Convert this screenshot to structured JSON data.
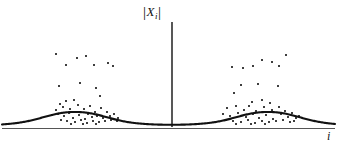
{
  "figure": {
    "title": "",
    "background_color": "#ffffff",
    "ink_color": "#111111",
    "width": 343,
    "height": 147
  },
  "labels": {
    "y_axis": "|X_i|",
    "y_axis_bar_left": "|",
    "y_axis_symbol": "X",
    "y_axis_subscript": "i",
    "y_axis_bar_right": "|",
    "x_axis": "i"
  },
  "axes": {
    "vertical_axis_x": 172,
    "vertical_axis_top": 22,
    "vertical_axis_bottom": 127,
    "baseline_y": 126,
    "baseline_left": 2,
    "baseline_right": 335,
    "grid": false,
    "ticks": [],
    "tick_labels": []
  },
  "chart_data": {
    "type": "scatter",
    "title": "",
    "xlabel": "i",
    "ylabel": "|X_i|",
    "xlim": [
      0,
      343
    ],
    "ylim": [
      0,
      1
    ],
    "grid": false,
    "legend": null,
    "envelope": {
      "name": "baseline-envelope",
      "kind": "two-peak-curve",
      "peaks": [
        {
          "center_x": 75,
          "peak_y": 112,
          "half_width": 48
        },
        {
          "center_x": 268,
          "peak_y": 112,
          "half_width": 48
        }
      ],
      "floor_y": 126
    },
    "series": [
      {
        "name": "left-cluster",
        "marker": "dot",
        "points": [
          [
            56,
            54
          ],
          [
            77,
            58
          ],
          [
            86,
            56
          ],
          [
            66,
            65
          ],
          [
            94,
            65
          ],
          [
            108,
            63
          ],
          [
            113,
            66
          ],
          [
            59,
            86
          ],
          [
            80,
            83
          ],
          [
            96,
            88
          ],
          [
            100,
            96
          ],
          [
            60,
            104
          ],
          [
            66,
            101
          ],
          [
            74,
            100
          ],
          [
            56,
            110
          ],
          [
            63,
            107
          ],
          [
            70,
            109
          ],
          [
            78,
            105
          ],
          [
            84,
            109
          ],
          [
            90,
            106
          ],
          [
            95,
            112
          ],
          [
            101,
            108
          ],
          [
            52,
            115
          ],
          [
            58,
            114
          ],
          [
            64,
            116
          ],
          [
            69,
            113
          ],
          [
            73,
            118
          ],
          [
            79,
            115
          ],
          [
            85,
            119
          ],
          [
            88,
            114
          ],
          [
            92,
            117
          ],
          [
            97,
            116
          ],
          [
            103,
            118
          ],
          [
            107,
            112
          ],
          [
            110,
            116
          ],
          [
            114,
            114
          ],
          [
            118,
            118
          ],
          [
            61,
            120
          ],
          [
            67,
            121
          ],
          [
            75,
            122
          ],
          [
            81,
            120
          ],
          [
            87,
            123
          ],
          [
            93,
            121
          ],
          [
            99,
            122
          ],
          [
            105,
            121
          ],
          [
            111,
            120
          ],
          [
            71,
            124
          ],
          [
            83,
            124
          ],
          [
            96,
            124
          ],
          [
            117,
            121
          ]
        ]
      },
      {
        "name": "right-cluster",
        "marker": "dot",
        "points": [
          [
            286,
            55
          ],
          [
            262,
            60
          ],
          [
            272,
            62
          ],
          [
            232,
            67
          ],
          [
            253,
            66
          ],
          [
            279,
            66
          ],
          [
            243,
            68
          ],
          [
            241,
            85
          ],
          [
            258,
            84
          ],
          [
            278,
            86
          ],
          [
            234,
            93
          ],
          [
            252,
            102
          ],
          [
            262,
            100
          ],
          [
            270,
            103
          ],
          [
            227,
            108
          ],
          [
            236,
            106
          ],
          [
            244,
            110
          ],
          [
            249,
            106
          ],
          [
            256,
            111
          ],
          [
            264,
            107
          ],
          [
            272,
            110
          ],
          [
            279,
            107
          ],
          [
            285,
            111
          ],
          [
            223,
            114
          ],
          [
            230,
            116
          ],
          [
            238,
            113
          ],
          [
            246,
            117
          ],
          [
            253,
            114
          ],
          [
            259,
            118
          ],
          [
            266,
            115
          ],
          [
            273,
            119
          ],
          [
            281,
            114
          ],
          [
            288,
            117
          ],
          [
            292,
            113
          ],
          [
            296,
            118
          ],
          [
            226,
            120
          ],
          [
            233,
            121
          ],
          [
            241,
            122
          ],
          [
            248,
            120
          ],
          [
            255,
            123
          ],
          [
            262,
            121
          ],
          [
            269,
            122
          ],
          [
            276,
            121
          ],
          [
            283,
            120
          ],
          [
            290,
            122
          ],
          [
            236,
            124
          ],
          [
            251,
            124
          ],
          [
            265,
            124
          ],
          [
            294,
            121
          ],
          [
            299,
            116
          ]
        ]
      }
    ]
  }
}
